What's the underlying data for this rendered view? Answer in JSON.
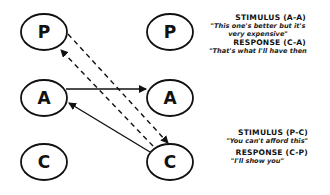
{
  "diagram": {
    "left_column": [
      {
        "label": "P",
        "cx": 44,
        "cy": 32
      },
      {
        "label": "A",
        "cx": 44,
        "cy": 98
      },
      {
        "label": "C",
        "cx": 44,
        "cy": 162
      }
    ],
    "right_column": [
      {
        "label": "P",
        "cx": 170,
        "cy": 32
      },
      {
        "label": "A",
        "cx": 170,
        "cy": 98
      },
      {
        "label": "C",
        "cx": 170,
        "cy": 162
      }
    ],
    "arrows": [
      {
        "from": "left-A",
        "to": "right-A",
        "style": "solid"
      },
      {
        "from": "right-C",
        "to": "left-A",
        "style": "solid"
      },
      {
        "from": "left-P",
        "to": "right-C",
        "style": "dashed"
      },
      {
        "from": "right-C",
        "to": "left-P",
        "style": "dashed"
      }
    ]
  },
  "captions": {
    "top": {
      "stimulus_title": "STIMULUS (A-A)",
      "stimulus_quote_line1": "\"This one's better but it's",
      "stimulus_quote_line2": "very expensive\"",
      "response_title": "RESPONSE (C-A)",
      "response_quote": "\"That's what I'll have then"
    },
    "bottom": {
      "stimulus_title": "STIMULUS (P-C)",
      "stimulus_quote": "\"You can't afford this\"",
      "response_title": "RESPONSE (C-P)",
      "response_quote": "\"I'll show you\""
    }
  }
}
